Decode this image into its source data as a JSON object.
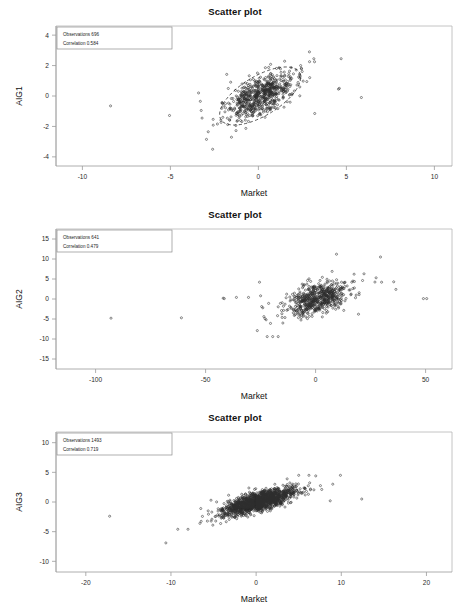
{
  "figure": {
    "background": "#ffffff",
    "point_color": "#2e2e2e",
    "axis_color": "#9a9a9a",
    "panel_count": 3
  },
  "chart_data": [
    {
      "type": "scatter",
      "title": "Scatter plot",
      "xlabel": "Market",
      "ylabel": "AIG1",
      "xlim": [
        -11.5,
        11.0
      ],
      "ylim": [
        -4.6,
        4.6
      ],
      "xticks": [
        -10,
        -5,
        0,
        5,
        10
      ],
      "yticks": [
        -4,
        -2,
        0,
        2,
        4
      ],
      "xticklabels": [
        "-10",
        "-5",
        "0",
        "5",
        "10"
      ],
      "yticklabels": [
        "-4",
        "-2",
        "0",
        "2",
        "4"
      ],
      "grid": false,
      "legend": {
        "position": "top-left",
        "observations_label": "Observations",
        "observations_value": "696",
        "correlation_label": "Correlation",
        "correlation_value": "0.584"
      },
      "observations": 696,
      "correlation": 0.584,
      "ellipse": {
        "visible": true,
        "center": [
          0.1,
          0.0
        ],
        "width": 5.2,
        "height": 2.6,
        "angle_deg": -31,
        "style": "dashed"
      },
      "cluster": {
        "x_mean": 0.15,
        "x_sd": 0.95,
        "y_mean": 0.0,
        "y_sd": 0.78
      },
      "outliers": [
        [
          -8.4,
          -0.65
        ],
        [
          -5.05,
          -1.28
        ],
        [
          -3.4,
          0.2
        ],
        [
          -3.3,
          -0.35
        ],
        [
          -3.25,
          -0.95
        ],
        [
          -3.2,
          -1.45
        ],
        [
          -2.95,
          -2.85
        ],
        [
          -2.85,
          -2.35
        ],
        [
          -2.6,
          -3.5
        ],
        [
          -1.8,
          1.42
        ],
        [
          2.9,
          2.9
        ],
        [
          3.15,
          2.45
        ],
        [
          3.2,
          -1.15
        ],
        [
          4.55,
          0.45
        ],
        [
          4.6,
          0.5
        ],
        [
          4.7,
          2.45
        ],
        [
          5.85,
          -0.1
        ]
      ]
    },
    {
      "type": "scatter",
      "title": "Scatter plot",
      "xlabel": "Market",
      "ylabel": "AIG2",
      "xlim": [
        -118,
        62
      ],
      "ylim": [
        -17.5,
        17.5
      ],
      "xticks": [
        -100,
        -50,
        0,
        50
      ],
      "yticks": [
        -15,
        -10,
        -5,
        0,
        5,
        10,
        15
      ],
      "xticklabels": [
        "-100",
        "-50",
        "0",
        "50"
      ],
      "yticklabels": [
        "-15",
        "-10",
        "-5",
        "0",
        "5",
        "10",
        "15"
      ],
      "grid": false,
      "legend": {
        "position": "top-left",
        "observations_label": "Observations",
        "observations_value": "641",
        "correlation_label": "Correlation",
        "correlation_value": "0.479"
      },
      "observations": 641,
      "correlation": 0.479,
      "ellipse": {
        "visible": false
      },
      "cluster": {
        "x_mean": 1.0,
        "x_sd": 7.0,
        "y_mean": 0.1,
        "y_sd": 2.1
      },
      "outliers": [
        [
          -93.0,
          -4.8
        ],
        [
          -61.0,
          -4.7
        ],
        [
          -42.0,
          0.2
        ],
        [
          -41.5,
          0.1
        ],
        [
          -36.0,
          0.4
        ],
        [
          -30.5,
          0.4
        ],
        [
          -25.5,
          4.2
        ],
        [
          -25.0,
          0.8
        ],
        [
          -24.5,
          -1.9
        ],
        [
          -24.0,
          -2.2
        ],
        [
          -23.5,
          -4.4
        ],
        [
          -23.0,
          -4.9
        ],
        [
          -22.5,
          -5.2
        ],
        [
          -22.0,
          -9.4
        ],
        [
          -20.5,
          -6.1
        ],
        [
          -19.5,
          -9.4
        ],
        [
          -17.0,
          -9.4
        ],
        [
          -26.5,
          -7.9
        ],
        [
          9.5,
          11.2
        ],
        [
          29.5,
          10.5
        ],
        [
          19.5,
          -3.8
        ],
        [
          27.5,
          5.3
        ],
        [
          30.0,
          4.2
        ],
        [
          35.5,
          4.3
        ],
        [
          36.5,
          2.4
        ],
        [
          49.0,
          0.1
        ],
        [
          50.5,
          0.1
        ],
        [
          22.0,
          6.3
        ],
        [
          17.5,
          6.2
        ],
        [
          7.5,
          6.9
        ]
      ]
    },
    {
      "type": "scatter",
      "title": "Scatter plot",
      "xlabel": "Market",
      "ylabel": "AIG3",
      "xlim": [
        -23.5,
        23.0
      ],
      "ylim": [
        -11.8,
        11.8
      ],
      "xticks": [
        -20,
        -10,
        0,
        10,
        20
      ],
      "yticks": [
        -10,
        -5,
        0,
        5,
        10
      ],
      "xticklabels": [
        "-20",
        "-10",
        "0",
        "10",
        "20"
      ],
      "yticklabels": [
        "-10",
        "-5",
        "0",
        "5",
        "10"
      ],
      "grid": false,
      "legend": {
        "position": "top-left",
        "observations_label": "Observations",
        "observations_value": "1493",
        "correlation_label": "Correlation",
        "correlation_value": "0.719"
      },
      "observations": 1493,
      "correlation": 0.719,
      "ellipse": {
        "visible": false
      },
      "cluster": {
        "x_mean": 0.3,
        "x_sd": 2.1,
        "y_mean": 0.1,
        "y_sd": 1.15
      },
      "outliers": [
        [
          -17.2,
          -2.4
        ],
        [
          -10.6,
          -6.9
        ],
        [
          -9.2,
          -4.6
        ],
        [
          -8.0,
          -4.6
        ],
        [
          -6.6,
          -3.6
        ],
        [
          -6.5,
          -1.1
        ],
        [
          -5.3,
          0.3
        ],
        [
          9.9,
          4.5
        ],
        [
          9.0,
          3.0
        ],
        [
          8.7,
          0.2
        ],
        [
          12.4,
          0.5
        ],
        [
          7.0,
          4.4
        ],
        [
          6.2,
          4.5
        ],
        [
          5.0,
          4.5
        ]
      ]
    }
  ]
}
